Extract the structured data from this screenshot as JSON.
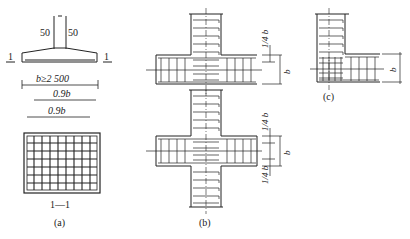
{
  "figure_a": {
    "caption": "(a)",
    "section_mark_left": "1",
    "section_mark_right": "1",
    "dim_left": "50",
    "dim_right": "50",
    "width_label": "b≥2 500",
    "bar1_label": "0.9b",
    "bar2_label": "0.9b",
    "section_label": "1—1"
  },
  "figure_b": {
    "caption": "(b)",
    "dim_top_quarter": "1/4 b",
    "dim_b_top": "b",
    "dim_b_bottom": "b",
    "dim_bottom_quarter": "1/4 b"
  },
  "figure_c": {
    "caption": "(c)",
    "dim_b": "b"
  }
}
